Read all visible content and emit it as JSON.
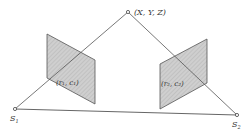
{
  "diagram": {
    "point_label": "(X, Y, Z)",
    "camera1_label": "S",
    "camera1_sub": "1",
    "camera2_label": "S",
    "camera2_sub": "2",
    "image1_label": "(r₁, c₁)",
    "image2_label": "(r₂, c₂)",
    "colors": {
      "line": "#555555",
      "plane_fill": "#c8c8c8",
      "hatch": "#b0b0b0"
    }
  }
}
